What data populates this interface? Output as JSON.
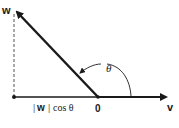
{
  "diagram": {
    "type": "vector-projection",
    "vectors": [
      {
        "name": "w",
        "label": "w",
        "from": [
          98,
          97
        ],
        "to": [
          15,
          10
        ]
      },
      {
        "name": "v",
        "label": "v",
        "from": [
          98,
          97
        ],
        "to": [
          166,
          97
        ]
      }
    ],
    "origin_label": "0",
    "angle_label": "θ",
    "projection_label": {
      "abs_open": "|",
      "vec": "w",
      "abs_close": "|",
      "rest": "cos θ"
    },
    "colors": {
      "ink": "#1a1a1a",
      "dashed": "#555555",
      "background": "#ffffff"
    }
  }
}
